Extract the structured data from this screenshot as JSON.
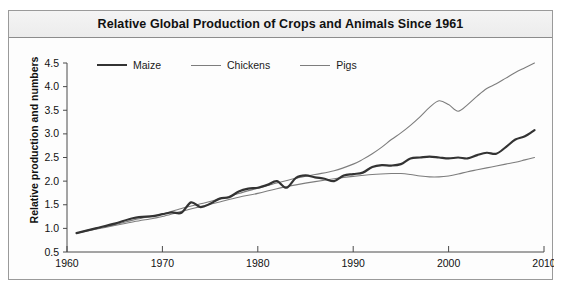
{
  "figure": {
    "title": "Relative Global Production of Crops and Animals Since 1961",
    "caption_clipped": ""
  },
  "axes": {
    "ylabel": "Relative production and numbers",
    "xlabel": "",
    "ytick_labels": [
      "4.5",
      "4.0",
      "3.5",
      "3.0",
      "2.5",
      "2.0",
      "1.5",
      "1.0",
      "0.5"
    ],
    "xtick_labels": [
      "1960",
      "1970",
      "1980",
      "1990",
      "2000",
      "2010"
    ]
  },
  "legend": {
    "items": [
      {
        "label": "Maize",
        "color": "#333333",
        "width": 2.2
      },
      {
        "label": "Chickens",
        "color": "#7d7d7d",
        "width": 1.1
      },
      {
        "label": "Pigs",
        "color": "#7d7d7d",
        "width": 1.1
      }
    ]
  },
  "chart_data": {
    "type": "line",
    "title": "Relative Global Production of Crops and Animals Since 1961",
    "xlabel": "",
    "ylabel": "Relative production and numbers",
    "xlim": [
      1960,
      2010
    ],
    "ylim": [
      0.5,
      4.5
    ],
    "xticks": [
      1960,
      1970,
      1980,
      1990,
      2000,
      2010
    ],
    "yticks": [
      0.5,
      1.0,
      1.5,
      2.0,
      2.5,
      3.0,
      3.5,
      4.0,
      4.5
    ],
    "grid": false,
    "legend_position": "top-left-inside",
    "series": [
      {
        "name": "Maize",
        "color": "#333333",
        "linewidth": 2.2,
        "x": [
          1961,
          1963,
          1965,
          1967,
          1969,
          1970,
          1971,
          1972,
          1973,
          1974,
          1975,
          1976,
          1977,
          1978,
          1979,
          1980,
          1981,
          1982,
          1983,
          1984,
          1985,
          1986,
          1987,
          1988,
          1989,
          1990,
          1991,
          1992,
          1993,
          1994,
          1995,
          1996,
          1997,
          1998,
          1999,
          2000,
          2001,
          2002,
          2003,
          2004,
          2005,
          2006,
          2007,
          2008,
          2009
        ],
        "y": [
          0.9,
          1.0,
          1.1,
          1.22,
          1.26,
          1.3,
          1.34,
          1.33,
          1.55,
          1.45,
          1.52,
          1.63,
          1.66,
          1.78,
          1.84,
          1.86,
          1.92,
          2.0,
          1.86,
          2.07,
          2.12,
          2.08,
          2.05,
          2.0,
          2.12,
          2.15,
          2.18,
          2.3,
          2.34,
          2.33,
          2.36,
          2.48,
          2.5,
          2.52,
          2.5,
          2.48,
          2.5,
          2.48,
          2.55,
          2.6,
          2.58,
          2.72,
          2.88,
          2.95,
          3.08
        ]
      },
      {
        "name": "Chickens",
        "color": "#7d7d7d",
        "linewidth": 1.1,
        "x": [
          1961,
          1963,
          1965,
          1967,
          1969,
          1970,
          1972,
          1974,
          1976,
          1978,
          1980,
          1982,
          1984,
          1986,
          1988,
          1990,
          1991,
          1992,
          1993,
          1994,
          1995,
          1996,
          1997,
          1998,
          1999,
          2000,
          2001,
          2002,
          2003,
          2004,
          2005,
          2006,
          2007,
          2008,
          2009
        ],
        "y": [
          0.9,
          1.0,
          1.08,
          1.18,
          1.26,
          1.3,
          1.42,
          1.52,
          1.62,
          1.74,
          1.85,
          1.96,
          2.06,
          2.14,
          2.22,
          2.36,
          2.46,
          2.58,
          2.72,
          2.88,
          3.02,
          3.18,
          3.36,
          3.56,
          3.7,
          3.62,
          3.48,
          3.62,
          3.8,
          3.96,
          4.06,
          4.18,
          4.3,
          4.4,
          4.5
        ]
      },
      {
        "name": "Pigs",
        "color": "#7d7d7d",
        "linewidth": 1.1,
        "x": [
          1961,
          1963,
          1965,
          1967,
          1969,
          1970,
          1972,
          1974,
          1976,
          1978,
          1980,
          1982,
          1984,
          1986,
          1988,
          1990,
          1992,
          1994,
          1995,
          1996,
          1997,
          1998,
          1999,
          2000,
          2001,
          2002,
          2003,
          2004,
          2005,
          2006,
          2007,
          2008,
          2009
        ],
        "y": [
          0.9,
          0.98,
          1.06,
          1.14,
          1.21,
          1.25,
          1.36,
          1.46,
          1.56,
          1.66,
          1.74,
          1.84,
          1.92,
          1.99,
          2.05,
          2.1,
          2.14,
          2.16,
          2.16,
          2.14,
          2.11,
          2.09,
          2.09,
          2.11,
          2.15,
          2.2,
          2.24,
          2.28,
          2.32,
          2.36,
          2.4,
          2.45,
          2.5
        ]
      }
    ]
  }
}
